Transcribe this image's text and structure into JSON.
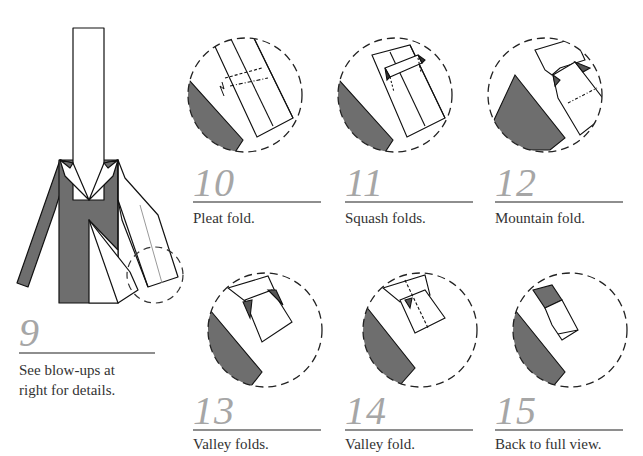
{
  "colors": {
    "paper_dark": "#6e6e6e",
    "paper_light": "#ffffff",
    "outline": "#111111",
    "step_number": "#a6a6a6",
    "rule": "#8e8e8e",
    "caption": "#333333"
  },
  "steps": [
    {
      "number": "9",
      "caption": "See blow-ups at\nright for details."
    },
    {
      "number": "10",
      "caption": "Pleat fold."
    },
    {
      "number": "11",
      "caption": "Squash folds."
    },
    {
      "number": "12",
      "caption": "Mountain fold."
    },
    {
      "number": "13",
      "caption": "Valley folds."
    },
    {
      "number": "14",
      "caption": "Valley fold."
    },
    {
      "number": "15",
      "caption": "Back to full view."
    }
  ]
}
